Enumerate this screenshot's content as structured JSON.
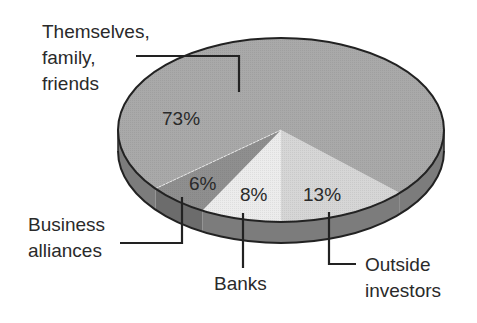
{
  "chart_data": {
    "type": "pie",
    "style": "3d",
    "title": "",
    "slices": [
      {
        "label": "Themselves, family, friends",
        "value": 73,
        "value_label": "73%",
        "color": "#a9a9a9",
        "side_color": "#7c7c7c"
      },
      {
        "label": "Business alliances",
        "value": 6,
        "value_label": "6%",
        "color": "#8f8f8f",
        "side_color": "#6c6c6c"
      },
      {
        "label": "Banks",
        "value": 8,
        "value_label": "8%",
        "color": "#ececec",
        "side_color": "#7c7c7c"
      },
      {
        "label": "Outside investors",
        "value": 13,
        "value_label": "13%",
        "color": "#d6d6d6",
        "side_color": "#7c7c7c"
      }
    ],
    "legend": "none (callout labels with leader lines)",
    "outline_color": "#222222"
  },
  "labels": {
    "themselves": [
      "Themselves,",
      "family,",
      "friends"
    ],
    "business": [
      "Business",
      "alliances"
    ],
    "banks": [
      "Banks"
    ],
    "outside": [
      "Outside",
      "investors"
    ]
  },
  "percentages": {
    "themselves": "73%",
    "business": "6%",
    "banks": "8%",
    "outside": "13%"
  }
}
